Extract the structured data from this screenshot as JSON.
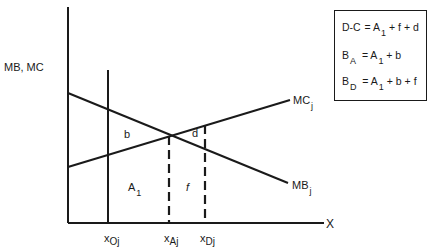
{
  "diagram": {
    "y_axis_label": "MB, MC",
    "x_axis_label": "X",
    "curves": {
      "mc": {
        "label": "MC",
        "subscript": "j"
      },
      "mb": {
        "label": "MB",
        "subscript": "j"
      }
    },
    "x_ticks": [
      {
        "base": "x",
        "subscript": "Oj"
      },
      {
        "base": "x",
        "subscript": "Aj"
      },
      {
        "base": "x",
        "subscript": "Dj"
      }
    ],
    "regions": {
      "b": "b",
      "a1": {
        "base": "A",
        "subscript": "1"
      },
      "f": "f",
      "d": "d"
    },
    "legend": [
      {
        "lhs": "D-C",
        "lhs_sub": "",
        "eq": "=",
        "a": "A",
        "a_sub": "1",
        "rest": "+ f + d"
      },
      {
        "lhs": "B",
        "lhs_sub": "A",
        "eq": "=",
        "a": "A",
        "a_sub": "1",
        "rest": "+ b"
      },
      {
        "lhs": "B",
        "lhs_sub": "D",
        "eq": "=",
        "a": "A",
        "a_sub": "1",
        "rest": "+ b + f"
      }
    ],
    "colors": {
      "ink": "#1a1a1a",
      "background": "#ffffff"
    }
  }
}
